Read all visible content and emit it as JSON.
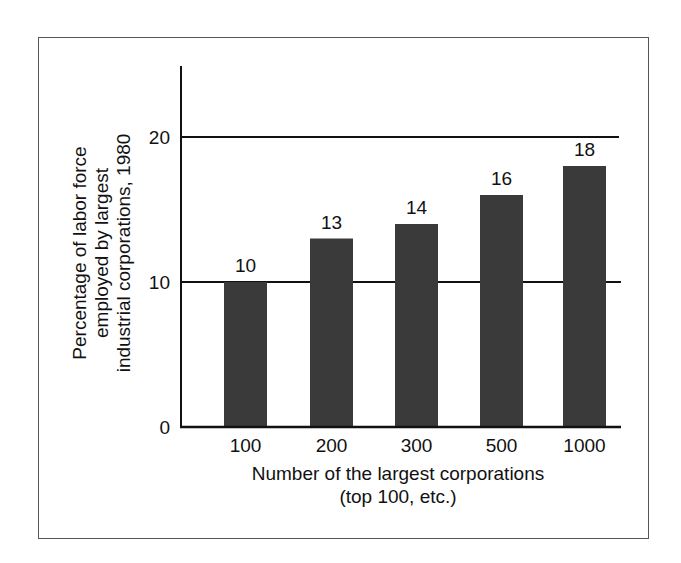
{
  "chart_data": {
    "type": "bar",
    "title": "",
    "categories": [
      "100",
      "200",
      "300",
      "500",
      "1000"
    ],
    "values": [
      10,
      13,
      14,
      16,
      18
    ],
    "data_labels": [
      "10",
      "13",
      "14",
      "16",
      "18"
    ],
    "xlabel": "Number of the largest corporations",
    "xlabel_line2": "(top 100, etc.)",
    "ylabel_lines": [
      "Percentage of labor force",
      "employed by largest",
      "industrial corporations, 1980"
    ],
    "yticks": [
      "0",
      "10",
      "20"
    ],
    "ylim": [
      0,
      25
    ],
    "grid": "horizontal lines at 10 and 20",
    "legend": "none",
    "bar_color": "#3a3a3a"
  }
}
